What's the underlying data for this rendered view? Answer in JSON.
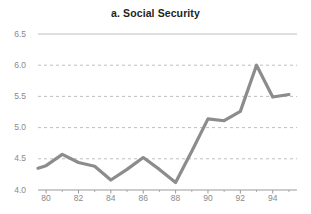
{
  "chart_data": {
    "type": "line",
    "title": "a. Social Security",
    "xlabel": "",
    "ylabel": "",
    "xlim": [
      79.5,
      95.5
    ],
    "ylim": [
      4.0,
      6.5
    ],
    "grid": true,
    "legend": false,
    "x_ticks": [
      "80",
      "82",
      "84",
      "86",
      "88",
      "90",
      "92",
      "94"
    ],
    "x_tick_values": [
      80,
      82,
      84,
      86,
      88,
      90,
      92,
      94
    ],
    "x_minor_ticks": [
      81,
      83,
      85,
      87,
      89,
      91,
      93,
      95
    ],
    "y_ticks": [
      "4.0",
      "4.5",
      "5.0",
      "5.5",
      "6.0",
      "6.5"
    ],
    "y_tick_values": [
      4.0,
      4.5,
      5.0,
      5.5,
      6.0,
      6.5
    ],
    "series": [
      {
        "name": "Social Security",
        "color": "#8c8c8c",
        "x": [
          79.5,
          80,
          81,
          82,
          83,
          84,
          85,
          86,
          87,
          88,
          89,
          90,
          91,
          92,
          93,
          94,
          95
        ],
        "values": [
          4.35,
          4.39,
          4.57,
          4.44,
          4.38,
          4.16,
          4.33,
          4.52,
          4.33,
          4.12,
          4.62,
          5.14,
          5.11,
          5.26,
          6.0,
          5.49,
          5.53
        ]
      }
    ],
    "colors": {
      "line": "#8c8c8c",
      "grid": "#b7b7b7",
      "axis": "#9a9a9a",
      "tick_text": "#8a8a8a",
      "title_text": "#231f20",
      "background": "#ffffff"
    }
  }
}
